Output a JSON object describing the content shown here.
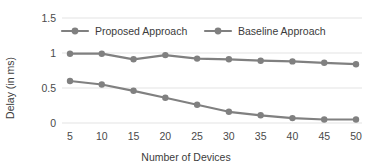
{
  "chart_data": {
    "type": "line",
    "title": "",
    "xlabel": "Number of Devices",
    "ylabel": "Delay (in ms)",
    "x": [
      5,
      10,
      15,
      20,
      25,
      30,
      35,
      40,
      45,
      50
    ],
    "categories": [
      "5",
      "10",
      "15",
      "20",
      "25",
      "30",
      "35",
      "40",
      "45",
      "50"
    ],
    "xtick_labels": [
      "5",
      "10",
      "15",
      "20",
      "25",
      "30",
      "35",
      "40",
      "45",
      "50"
    ],
    "ytick_labels": [
      "0",
      "0.5",
      "1",
      "1.5"
    ],
    "yticks": [
      0,
      0.5,
      1,
      1.5
    ],
    "ylim": [
      0,
      1.5
    ],
    "xlim": [
      5,
      50
    ],
    "grid": "horizontal",
    "legend_position": "top-inside",
    "series": [
      {
        "name": "Proposed Approach",
        "color": "#808080",
        "marker": "circle",
        "values": [
          0.6,
          0.55,
          0.46,
          0.36,
          0.26,
          0.16,
          0.11,
          0.07,
          0.05,
          0.05
        ]
      },
      {
        "name": "Baseline Approach",
        "color": "#808080",
        "marker": "circle",
        "values": [
          0.99,
          0.99,
          0.91,
          0.97,
          0.92,
          0.91,
          0.89,
          0.88,
          0.86,
          0.84
        ]
      }
    ]
  },
  "colors": {
    "series": "#808080",
    "gridline": "#e3e3e3",
    "text": "#3b3b3b",
    "background": "#ffffff"
  }
}
